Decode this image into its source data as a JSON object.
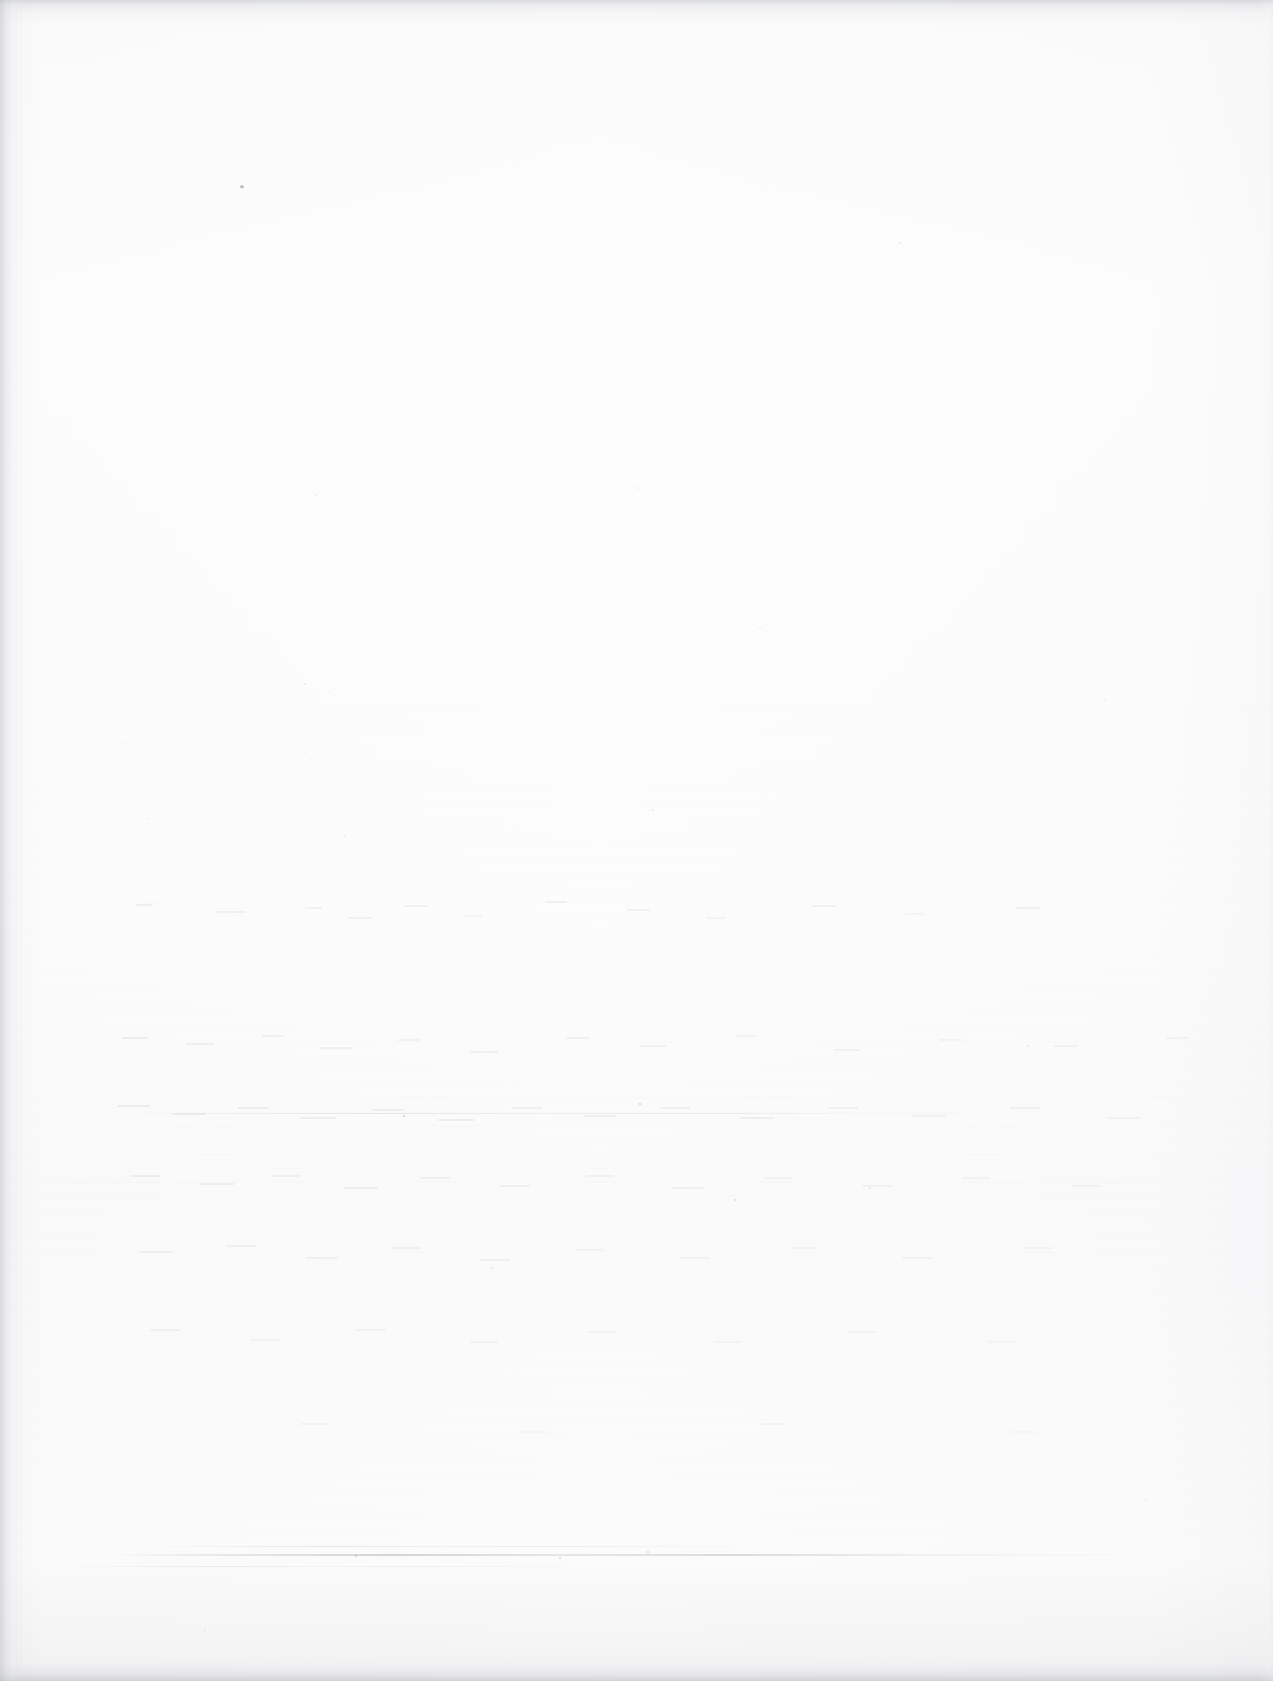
{
  "document": {
    "kind": "blank-scanned-page",
    "title": "Blank Scanned Page",
    "page_width_px": 1273,
    "page_height_px": 1681,
    "text_content": "",
    "visible_text_elements": [],
    "notes_label": "",
    "page_number_label": "",
    "header_label": "",
    "footer_label": ""
  },
  "colors": {
    "paper": "#fdfdfd",
    "paper_bright": "#ffffff",
    "paper_tint": "#f7f7f8",
    "edge_fringe": "#b0b2b6",
    "gutter_streak": "#c4c6cb",
    "speckle": "#a8a8ae",
    "smudge": "#b2b4b9",
    "scanband": "#e9eaed"
  },
  "artifacts": {
    "edge_fringe_top_label": "top edge scan fringe",
    "edge_fringe_bottom_label": "bottom edge scan fringe",
    "edge_fringe_left_label": "left gutter scan fringe",
    "edge_fringe_right_label": "right edge scan fringe",
    "gutter_streaks_label": "left gutter vertical streaks",
    "scanbands_label": "horizontal scan line texture",
    "smudge_label": "faint horizontal smudge streak",
    "speckles_label": "scanner dust speckles",
    "dust_speck_label": "dust speck"
  }
}
